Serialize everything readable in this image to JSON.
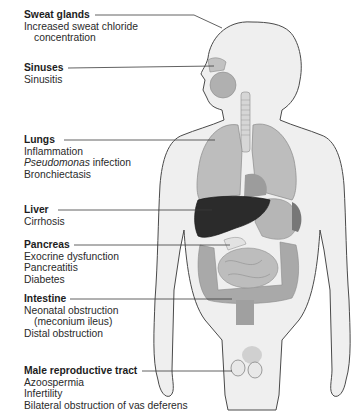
{
  "diagram": {
    "colors": {
      "background": "#ffffff",
      "body_fill": "#efefef",
      "body_outline": "#4a4a4a",
      "organ_light": "#c8c8c8",
      "organ_mid": "#a9a9a9",
      "liver": "#2b2b2b",
      "leader_line": "#3a3a3a",
      "text": "#2a2a2a"
    },
    "labels": [
      {
        "organ": "Sweat glands",
        "lines": [
          "Increased sweat chloride",
          "concentration"
        ]
      },
      {
        "organ": "Sinuses",
        "lines": [
          "Sinusitis"
        ]
      },
      {
        "organ": "Lungs",
        "lines": [
          "Inflammation",
          "Pseudomonas",
          " infection",
          "Bronchiectasis"
        ]
      },
      {
        "organ": "Liver",
        "lines": [
          "Cirrhosis"
        ]
      },
      {
        "organ": "Pancreas",
        "lines": [
          "Exocrine dysfunction",
          "Pancreatitis",
          "Diabetes"
        ]
      },
      {
        "organ": "Intestine",
        "lines": [
          "Neonatal obstruction",
          "(meconium ileus)",
          "Distal obstruction"
        ]
      },
      {
        "organ": "Male reproductive tract",
        "lines": [
          "Azoospermia",
          "Infertility",
          "Bilateral obstruction of vas deferens"
        ]
      }
    ]
  }
}
